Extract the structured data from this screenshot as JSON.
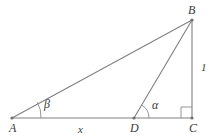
{
  "figure": {
    "type": "geometry-diagram",
    "background_color": "#ffffff",
    "stroke_color": "#808080",
    "label_color": "#3b3b3b",
    "vertices": [
      {
        "name": "A",
        "label": "A",
        "x": 12,
        "y": 118,
        "label_x": 9,
        "label_y": 122
      },
      {
        "name": "B",
        "label": "B",
        "x": 192,
        "y": 20,
        "label_x": 188,
        "label_y": 4
      },
      {
        "name": "C",
        "label": "C",
        "x": 192,
        "y": 118,
        "label_x": 189,
        "label_y": 122
      },
      {
        "name": "D",
        "label": "D",
        "x": 134,
        "y": 118,
        "label_x": 130,
        "label_y": 122
      }
    ],
    "segments": [
      {
        "name": "AB",
        "from": "A",
        "to": "B"
      },
      {
        "name": "AC",
        "from": "A",
        "to": "C"
      },
      {
        "name": "BC",
        "from": "B",
        "to": "C"
      },
      {
        "name": "DB",
        "from": "D",
        "to": "B"
      }
    ],
    "angles": [
      {
        "name": "beta",
        "label": "β",
        "at_vertex": "A",
        "label_x": 44,
        "label_y": 98
      },
      {
        "name": "alpha",
        "label": "α",
        "at_vertex": "D",
        "label_x": 152,
        "label_y": 99
      },
      {
        "name": "right-angle",
        "label": "",
        "at_vertex": "C"
      }
    ],
    "length_labels": [
      {
        "name": "x",
        "label": "x",
        "segment": "AD",
        "x": 78,
        "y": 124
      },
      {
        "name": "one",
        "label": "1",
        "segment": "BC",
        "x": 201,
        "y": 62
      }
    ]
  }
}
